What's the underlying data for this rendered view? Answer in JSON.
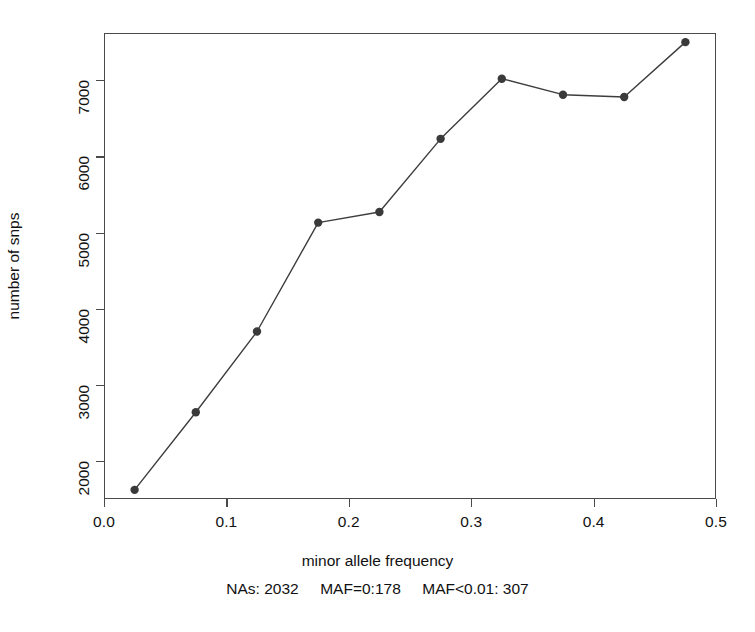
{
  "chart_data": {
    "type": "line",
    "title": "",
    "xlabel": "minor allele frequency",
    "ylabel": "number of snps",
    "subtitle": "NAs: 2032     MAF=0:178     MAF<0.01: 307",
    "x": [
      0.025,
      0.075,
      0.125,
      0.175,
      0.225,
      0.275,
      0.325,
      0.375,
      0.425,
      0.475
    ],
    "values": [
      1620,
      2640,
      3700,
      5130,
      5270,
      6230,
      7020,
      6810,
      6780,
      7500
    ],
    "series": [
      {
        "name": "number of snps",
        "x": [
          0.025,
          0.075,
          0.125,
          0.175,
          0.225,
          0.275,
          0.325,
          0.375,
          0.425,
          0.475
        ],
        "values": [
          1620,
          2640,
          3700,
          5130,
          5270,
          6230,
          7020,
          6810,
          6780,
          7500
        ]
      }
    ],
    "xlim": [
      0.0,
      0.5
    ],
    "ylim": [
      1500,
      7620
    ],
    "xticks": [
      "0.0",
      "0.1",
      "0.2",
      "0.3",
      "0.4",
      "0.5"
    ],
    "xtick_values": [
      0.0,
      0.1,
      0.2,
      0.3,
      0.4,
      0.5
    ],
    "yticks": [
      "2000",
      "3000",
      "4000",
      "5000",
      "6000",
      "7000"
    ],
    "ytick_values": [
      2000,
      3000,
      4000,
      5000,
      6000,
      7000
    ],
    "grid": false,
    "legend": "none",
    "marker": "filled-circle",
    "line_color": "#3d3d3d",
    "marker_color": "#3a3a3a",
    "frame_color": "#4a4a4a",
    "background": "#ffffff"
  }
}
